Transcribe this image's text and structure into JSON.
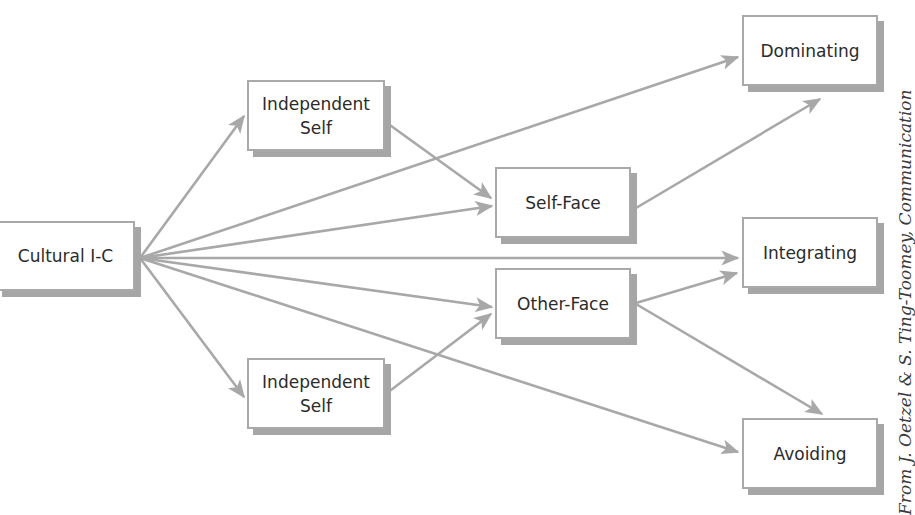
{
  "diagram": {
    "nodes": [
      {
        "id": "cultural",
        "line1": "Cultural I-C",
        "line2": ""
      },
      {
        "id": "indep_top",
        "line1": "Independent",
        "line2": "Self"
      },
      {
        "id": "indep_bottom",
        "line1": "Independent",
        "line2": "Self"
      },
      {
        "id": "self_face",
        "line1": "Self-Face",
        "line2": ""
      },
      {
        "id": "other_face",
        "line1": "Other-Face",
        "line2": ""
      },
      {
        "id": "dominating",
        "line1": "Dominating",
        "line2": ""
      },
      {
        "id": "integrating",
        "line1": "Integrating",
        "line2": ""
      },
      {
        "id": "avoiding",
        "line1": "Avoiding",
        "line2": ""
      }
    ],
    "edges": [
      {
        "from": "Cultural I-C",
        "to": "Independent Self (top)"
      },
      {
        "from": "Cultural I-C",
        "to": "Independent Self (bottom)"
      },
      {
        "from": "Cultural I-C",
        "to": "Dominating"
      },
      {
        "from": "Cultural I-C",
        "to": "Self-Face"
      },
      {
        "from": "Cultural I-C",
        "to": "Integrating"
      },
      {
        "from": "Cultural I-C",
        "to": "Other-Face"
      },
      {
        "from": "Cultural I-C",
        "to": "Avoiding"
      },
      {
        "from": "Independent Self (top)",
        "to": "Self-Face"
      },
      {
        "from": "Independent Self (bottom)",
        "to": "Other-Face"
      },
      {
        "from": "Self-Face",
        "to": "Dominating"
      },
      {
        "from": "Other-Face",
        "to": "Integrating"
      },
      {
        "from": "Other-Face",
        "to": "Avoiding"
      }
    ],
    "colors": {
      "arrow": "#a8a8a8",
      "border": "#a9a9a9",
      "shadow": "#a6a6a6",
      "text": "#2b2b2b"
    }
  },
  "credit": "From J. Oetzel & S. Ting-Toomey, Communication"
}
